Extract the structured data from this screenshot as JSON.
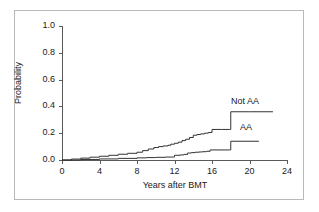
{
  "chart_data": {
    "type": "line",
    "title": "",
    "subtitle": "",
    "xlabel": "Years after BMT",
    "ylabel": "Probability",
    "xlim": [
      0,
      24
    ],
    "ylim": [
      0,
      1.0
    ],
    "xticks": [
      0,
      4,
      8,
      12,
      16,
      20,
      24
    ],
    "xtick_labels": [
      "0",
      "4",
      "8",
      "12",
      "16",
      "20",
      "24"
    ],
    "yticks": [
      0.0,
      0.2,
      0.4,
      0.6,
      0.8,
      1.0
    ],
    "ytick_labels": [
      "0.0",
      "0.2",
      "0.4",
      "0.6",
      "0.8",
      "1.0"
    ],
    "grid": false,
    "legend_position": "inline-right-of-curve",
    "line_color": "#333333",
    "background_color": "#ffffff",
    "frame_color": "#b9b9b9",
    "series": [
      {
        "name": "Not AA",
        "label": "Not AA",
        "style": "step",
        "x": [
          0,
          1.0,
          2.0,
          3.0,
          4.0,
          5.0,
          6.0,
          7.0,
          8.0,
          8.6,
          9.2,
          9.8,
          10.3,
          10.8,
          11.3,
          11.6,
          12.0,
          12.4,
          12.8,
          13.2,
          13.6,
          14.0,
          14.4,
          14.8,
          15.2,
          15.6,
          16.0,
          17.0,
          17.9,
          18.0,
          20.0,
          22.5
        ],
        "y": [
          0.0,
          0.007,
          0.014,
          0.021,
          0.028,
          0.035,
          0.043,
          0.05,
          0.058,
          0.07,
          0.082,
          0.093,
          0.1,
          0.105,
          0.11,
          0.118,
          0.125,
          0.133,
          0.145,
          0.155,
          0.168,
          0.185,
          0.19,
          0.195,
          0.2,
          0.205,
          0.228,
          0.228,
          0.228,
          0.36,
          0.36,
          0.36
        ],
        "final_value": 0.36
      },
      {
        "name": "AA",
        "label": "AA",
        "style": "step",
        "x": [
          0,
          2.0,
          4.0,
          6.0,
          8.0,
          9.0,
          10.0,
          11.0,
          11.9,
          12.0,
          12.6,
          13.0,
          13.4,
          13.8,
          14.2,
          14.6,
          15.0,
          15.4,
          15.8,
          17.9,
          18.0,
          21.0
        ],
        "y": [
          0.0,
          0.004,
          0.008,
          0.012,
          0.016,
          0.018,
          0.02,
          0.022,
          0.022,
          0.035,
          0.038,
          0.042,
          0.052,
          0.055,
          0.058,
          0.06,
          0.062,
          0.065,
          0.075,
          0.075,
          0.14,
          0.14
        ],
        "final_value": 0.14
      }
    ]
  },
  "axis": {
    "ylabel": "Probability",
    "xlabel": "Years after BMT"
  }
}
